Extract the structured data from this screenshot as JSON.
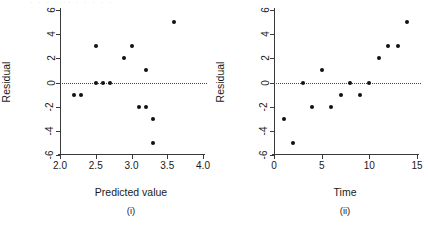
{
  "figure": {
    "background": "#ffffff",
    "point_color": "#111111",
    "axis_color": "#3a3a3a",
    "zero_line_color": "#4a4a4a",
    "crop_remnant_text": "· · ·   ·   ·· ·  ·   ·    ·  ·"
  },
  "chart_data": [
    {
      "type": "scatter",
      "title": "",
      "panel_tag": "(i)",
      "xlabel": "Predicted value",
      "ylabel": "Residual",
      "xlim": [
        2.0,
        4.0
      ],
      "ylim": [
        -6,
        6
      ],
      "xticks": [
        2.0,
        2.5,
        3.0,
        3.5,
        4.0
      ],
      "xtick_labels": [
        "2.0",
        "2.5",
        "3.0",
        "3.5",
        "4.0"
      ],
      "yticks": [
        6,
        4,
        2,
        0,
        -2,
        -4,
        -6
      ],
      "ytick_labels": [
        "6",
        "4",
        "2",
        "0",
        "-2",
        "-4",
        "-6"
      ],
      "grid": false,
      "legend": "none",
      "reference_line": {
        "axis": "y",
        "value": 0,
        "style": "dotted"
      },
      "points": [
        {
          "x": 2.2,
          "y": -1
        },
        {
          "x": 2.3,
          "y": -1
        },
        {
          "x": 2.5,
          "y": 3
        },
        {
          "x": 2.5,
          "y": 0
        },
        {
          "x": 2.6,
          "y": 0
        },
        {
          "x": 2.7,
          "y": 0
        },
        {
          "x": 2.9,
          "y": 2
        },
        {
          "x": 3.0,
          "y": 3
        },
        {
          "x": 3.1,
          "y": -2
        },
        {
          "x": 3.2,
          "y": 1
        },
        {
          "x": 3.2,
          "y": -2
        },
        {
          "x": 3.3,
          "y": -3
        },
        {
          "x": 3.3,
          "y": -5
        },
        {
          "x": 3.6,
          "y": 5
        }
      ]
    },
    {
      "type": "scatter",
      "title": "",
      "panel_tag": "(ii)",
      "xlabel": "Time",
      "ylabel": "Residual",
      "xlim": [
        0,
        15
      ],
      "ylim": [
        -6,
        6
      ],
      "xticks": [
        0,
        5,
        10,
        15
      ],
      "xtick_labels": [
        "0",
        "5",
        "10",
        "15"
      ],
      "yticks": [
        6,
        4,
        2,
        0,
        -2,
        -4,
        -6
      ],
      "ytick_labels": [
        "6",
        "4",
        "2",
        "0",
        "-2",
        "-4",
        "-6"
      ],
      "grid": false,
      "legend": "none",
      "reference_line": {
        "axis": "y",
        "value": 0,
        "style": "dotted"
      },
      "points": [
        {
          "x": 1,
          "y": -3
        },
        {
          "x": 2,
          "y": -5
        },
        {
          "x": 3,
          "y": 0
        },
        {
          "x": 4,
          "y": -2
        },
        {
          "x": 5,
          "y": 1
        },
        {
          "x": 6,
          "y": -2
        },
        {
          "x": 7,
          "y": -1
        },
        {
          "x": 8,
          "y": 0
        },
        {
          "x": 9,
          "y": -1
        },
        {
          "x": 10,
          "y": 0
        },
        {
          "x": 11,
          "y": 2
        },
        {
          "x": 12,
          "y": 3
        },
        {
          "x": 13,
          "y": 3
        },
        {
          "x": 14,
          "y": 5
        }
      ]
    }
  ]
}
